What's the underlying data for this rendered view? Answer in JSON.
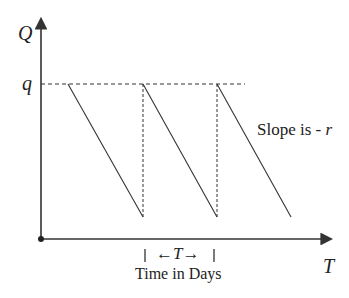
{
  "diagram": {
    "y_axis_label": "Q",
    "x_axis_label": "T",
    "q_level_label": "q",
    "slope_annotation": "Slope is - r",
    "slope_prefix": "Slope is -",
    "slope_var": "r",
    "period_left_arrow": "←",
    "period_var": "T",
    "period_right_arrow": "→",
    "period_caption": "Time in Days",
    "cycles": 3,
    "colors": {
      "line": "#333333",
      "dashed": "#333333",
      "text": "#222222"
    }
  }
}
